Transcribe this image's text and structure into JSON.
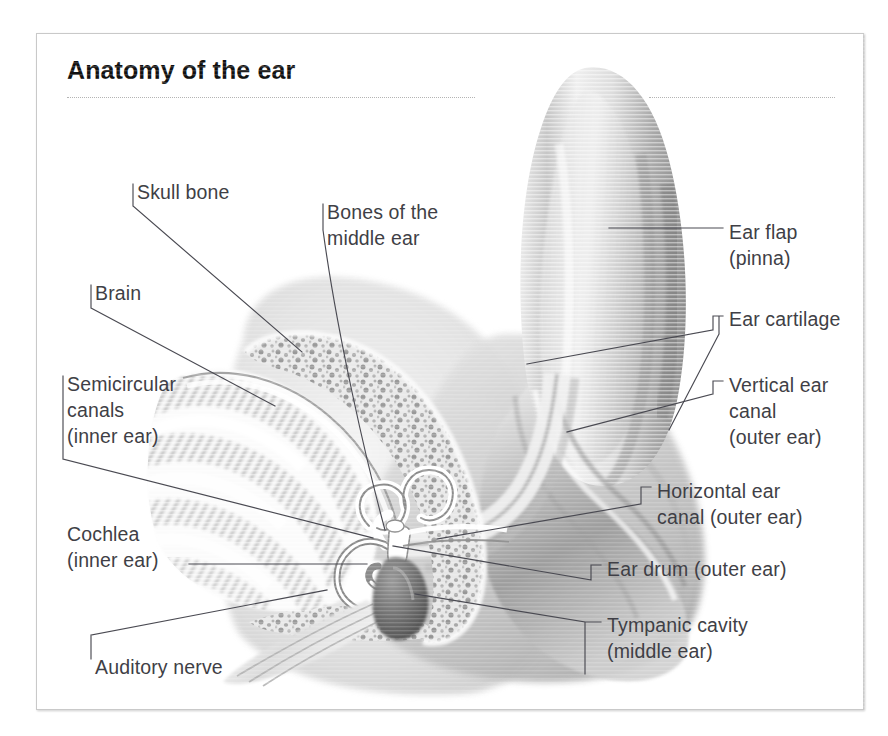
{
  "document": {
    "title": "Anatomy of the ear",
    "kind": "anatomical-illustration",
    "subject": "ear",
    "view": "cross-section",
    "rule_style": "dotted"
  },
  "colors": {
    "page_background": "#ffffff",
    "frame_border": "#c9c9c9",
    "title_text": "#111111",
    "label_text": "#3f3f46",
    "leader_line": "#4a4a52",
    "dotted_rule": "#b4b4b4",
    "illustration_light": "#f2f2f2",
    "illustration_mid": "#c2c2c2",
    "illustration_dark": "#6e6e6e",
    "bone_speckle": "#8a8a8a"
  },
  "labels": [
    {
      "id": "skull-bone",
      "text": "Skull bone",
      "side": "left",
      "x": 100,
      "y": 145,
      "tick": "left",
      "leader": "M 96,150 L 96,172 M 96,172 L 265,318"
    },
    {
      "id": "brain",
      "text": "Brain",
      "side": "left",
      "x": 58,
      "y": 246,
      "tick": "left",
      "leader": "M 54,251 L 54,274 M 54,274 L 238,372"
    },
    {
      "id": "semicircular-canals",
      "text": "Semicircular\ncanals\n(inner ear)",
      "side": "left",
      "x": 30,
      "y": 337,
      "tick": "left-tall",
      "leader": "M 26,342 L 26,425 M 26,425 L 336,504"
    },
    {
      "id": "cochlea",
      "text": "Cochlea\n(inner ear)",
      "side": "left",
      "x": 30,
      "y": 487,
      "tick": "none",
      "leader": "M 152,530 L 330,530"
    },
    {
      "id": "auditory-nerve",
      "text": "Auditory nerve",
      "side": "left",
      "x": 58,
      "y": 620,
      "tick": "left",
      "leader": "M 54,625 L 54,601 M 54,601 L 290,556"
    },
    {
      "id": "bones-of-the-middle-ear",
      "text": "Bones of the\nmiddle ear",
      "side": "left",
      "x": 290,
      "y": 165,
      "tick": "left",
      "leader": "M 286,170 L 286,196 M 286,196 C 300,300 330,430 348,496"
    },
    {
      "id": "ear-flap-pinna",
      "text": "Ear flap\n(pinna)",
      "side": "right",
      "x": 692,
      "y": 185,
      "tick": "none",
      "leader": "M 572,194 L 686,194"
    },
    {
      "id": "ear-cartilage",
      "text": "Ear cartilage",
      "side": "right",
      "x": 692,
      "y": 272,
      "tick": "bracket2",
      "leader": "M 686,282 L 676,282 M 676,282 L 676,296 M 676,296 L 490,330 M 682,282 L 682,300 M 682,300 L 632,396"
    },
    {
      "id": "vertical-ear-canal",
      "text": "Vertical ear\ncanal\n(outer ear)",
      "side": "right",
      "x": 692,
      "y": 338,
      "tick": "right-angle",
      "leader": "M 686,347 L 676,347 M 676,347 L 676,360 M 676,360 L 530,398"
    },
    {
      "id": "horizontal-ear-canal",
      "text": "Horizontal ear\ncanal (outer ear)",
      "side": "right",
      "x": 620,
      "y": 444,
      "tick": "right-angle",
      "leader": "M 614,453 L 604,453 M 604,453 L 604,470 M 604,470 L 400,505"
    },
    {
      "id": "ear-drum",
      "text": "Ear drum (outer ear)",
      "side": "right",
      "x": 570,
      "y": 522,
      "tick": "right-angle",
      "leader": "M 564,531 L 554,531 M 554,531 L 554,546 M 554,546 L 356,512"
    },
    {
      "id": "tympanic-cavity",
      "text": "Tympanic cavity\n(middle ear)",
      "side": "right",
      "x": 570,
      "y": 578,
      "tick": "bracket-tall",
      "leader": "M 564,588 L 548,588 M 548,588 L 548,640 M 548,588 L 378,560"
    }
  ],
  "illustration_parts": [
    {
      "id": "pinna",
      "name": "Ear flap (pinna)",
      "tone": "light-grey-gradient"
    },
    {
      "id": "ear-cartilage",
      "name": "Ear cartilage",
      "tone": "mid-grey"
    },
    {
      "id": "vertical-canal",
      "name": "Vertical ear canal",
      "tone": "mid-grey"
    },
    {
      "id": "horizontal-canal",
      "name": "Horizontal ear canal",
      "tone": "mid-grey"
    },
    {
      "id": "ear-drum",
      "name": "Ear drum",
      "tone": "white-highlight"
    },
    {
      "id": "ossicles",
      "name": "Bones of the middle ear",
      "tone": "white-highlight"
    },
    {
      "id": "tympanic-cavity",
      "name": "Tympanic cavity",
      "tone": "dark-grey"
    },
    {
      "id": "cochlea",
      "name": "Cochlea",
      "tone": "white-spiral"
    },
    {
      "id": "semicircular",
      "name": "Semicircular canals",
      "tone": "white-loops"
    },
    {
      "id": "auditory-nerve",
      "name": "Auditory nerve",
      "tone": "pale-striped"
    },
    {
      "id": "skull-bone",
      "name": "Skull bone",
      "tone": "speckled-bone"
    },
    {
      "id": "brain",
      "name": "Brain",
      "tone": "folded-gyri"
    }
  ]
}
